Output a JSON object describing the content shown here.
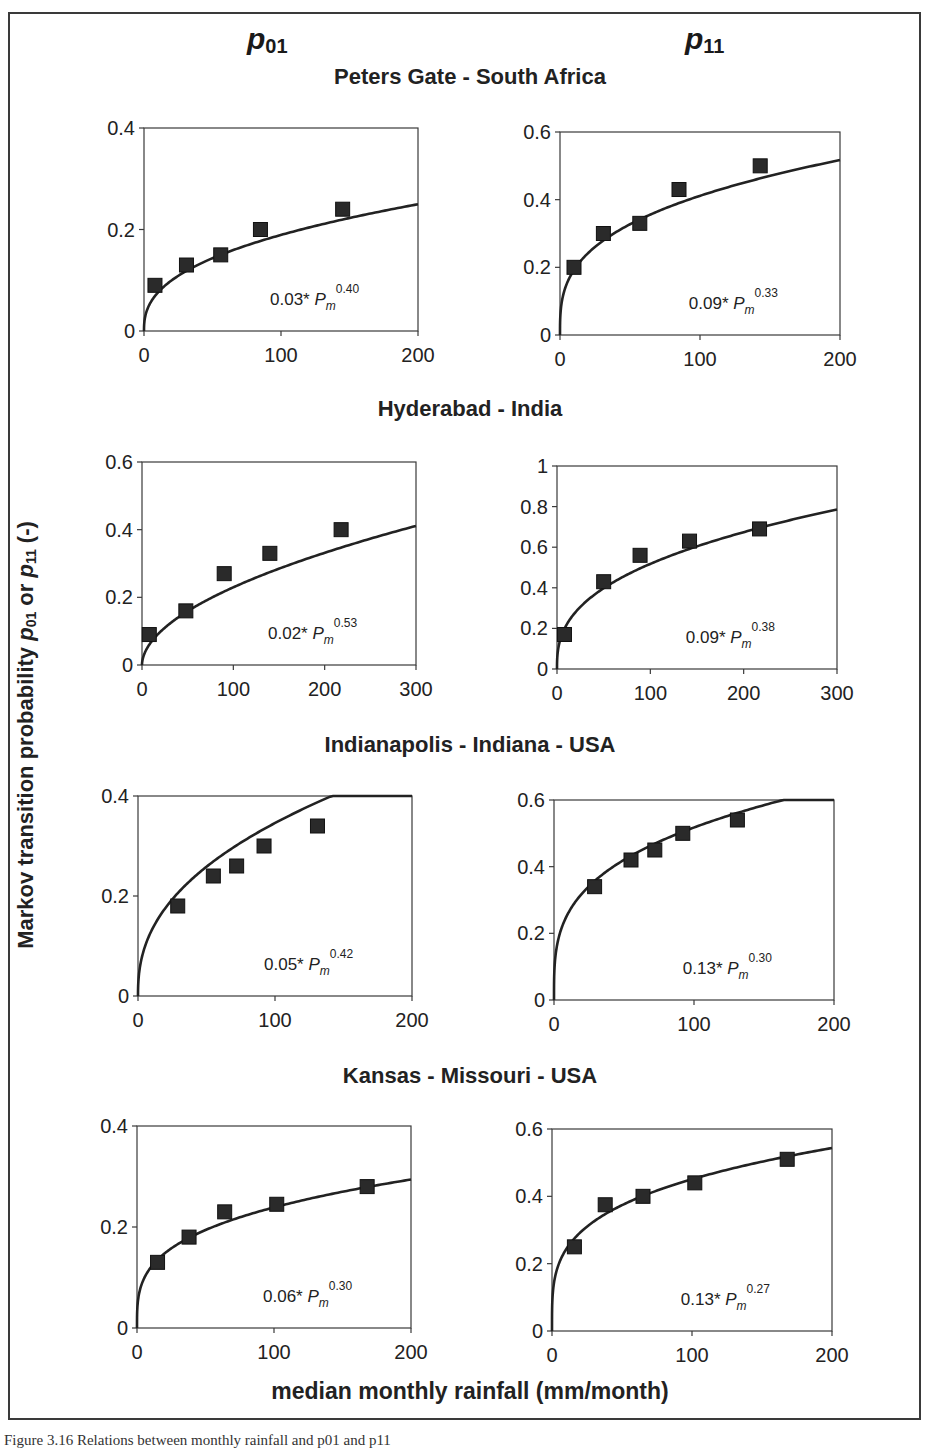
{
  "figure": {
    "column_headers": [
      {
        "base": "p",
        "sub": "01"
      },
      {
        "base": "p",
        "sub": "11"
      }
    ],
    "y_axis_label": {
      "prefix": "Markov transition probability ",
      "v1": "p",
      "s1": "01",
      "mid": " or ",
      "v2": "p",
      "s2": "11",
      "suffix": " (-)"
    },
    "x_axis_label": "median monthly rainfall (mm/month)",
    "caption": "Figure 3.16      Relations between monthly rainfall and p01 and p11"
  },
  "chart_data": [
    {
      "type": "scatter",
      "site": "Peters Gate - South Africa",
      "probability": "p01",
      "title": "",
      "xlabel": "",
      "ylabel": "",
      "xlim": [
        0,
        200
      ],
      "ylim": [
        0,
        0.4
      ],
      "xticks": [
        0,
        100,
        200
      ],
      "yticks": [
        0,
        0.2,
        0.4
      ],
      "points": {
        "x": [
          8,
          31,
          56,
          85,
          145
        ],
        "y": [
          0.09,
          0.13,
          0.15,
          0.2,
          0.24
        ]
      },
      "fit": {
        "a": 0.03,
        "b": 0.4,
        "label_coef": "0.03*",
        "label_exp": "0.40"
      },
      "grid": false
    },
    {
      "type": "scatter",
      "site": "Peters Gate - South Africa",
      "probability": "p11",
      "xlim": [
        0,
        200
      ],
      "ylim": [
        0,
        0.6
      ],
      "xticks": [
        0,
        100,
        200
      ],
      "yticks": [
        0,
        0.2,
        0.4,
        0.6
      ],
      "points": {
        "x": [
          10,
          31,
          57,
          85,
          143
        ],
        "y": [
          0.2,
          0.3,
          0.33,
          0.43,
          0.5
        ]
      },
      "fit": {
        "a": 0.09,
        "b": 0.33,
        "label_coef": "0.09*",
        "label_exp": "0.33"
      },
      "grid": false
    },
    {
      "type": "scatter",
      "site": "Hyderabad - India",
      "probability": "p01",
      "xlim": [
        0,
        300
      ],
      "ylim": [
        0,
        0.6
      ],
      "xticks": [
        0,
        100,
        200,
        300
      ],
      "yticks": [
        0,
        0.2,
        0.4,
        0.6
      ],
      "points": {
        "x": [
          8,
          48,
          90,
          140,
          218
        ],
        "y": [
          0.09,
          0.16,
          0.27,
          0.33,
          0.4
        ]
      },
      "fit": {
        "a": 0.02,
        "b": 0.53,
        "label_coef": "0.02*",
        "label_exp": "0.53"
      },
      "grid": false
    },
    {
      "type": "scatter",
      "site": "Hyderabad - India",
      "probability": "p11",
      "xlim": [
        0,
        300
      ],
      "ylim": [
        0,
        1
      ],
      "xticks": [
        0,
        100,
        200,
        300
      ],
      "yticks": [
        0,
        0.2,
        0.4,
        0.6,
        0.8,
        1
      ],
      "points": {
        "x": [
          8,
          50,
          89,
          142,
          217
        ],
        "y": [
          0.17,
          0.43,
          0.56,
          0.63,
          0.69
        ]
      },
      "fit": {
        "a": 0.09,
        "b": 0.38,
        "label_coef": "0.09*",
        "label_exp": "0.38"
      },
      "grid": false
    },
    {
      "type": "scatter",
      "site": "Indianapolis - Indiana - USA",
      "probability": "p01",
      "xlim": [
        0,
        200
      ],
      "ylim": [
        0,
        0.4
      ],
      "xticks": [
        0,
        100,
        200
      ],
      "yticks": [
        0,
        0.2,
        0.4
      ],
      "points": {
        "x": [
          29,
          55,
          72,
          92,
          131
        ],
        "y": [
          0.18,
          0.24,
          0.26,
          0.3,
          0.34
        ]
      },
      "fit": {
        "a": 0.05,
        "b": 0.42,
        "label_coef": "0.05*",
        "label_exp": "0.42"
      },
      "grid": false
    },
    {
      "type": "scatter",
      "site": "Indianapolis - Indiana - USA",
      "probability": "p11",
      "xlim": [
        0,
        200
      ],
      "ylim": [
        0,
        0.6
      ],
      "xticks": [
        0,
        100,
        200
      ],
      "yticks": [
        0,
        0.2,
        0.4,
        0.6
      ],
      "points": {
        "x": [
          29,
          55,
          72,
          92,
          131
        ],
        "y": [
          0.34,
          0.42,
          0.45,
          0.5,
          0.54
        ]
      },
      "fit": {
        "a": 0.13,
        "b": 0.3,
        "label_coef": "0.13*",
        "label_exp": "0.30"
      },
      "grid": false
    },
    {
      "type": "scatter",
      "site": "Kansas - Missouri - USA",
      "probability": "p01",
      "xlim": [
        0,
        200
      ],
      "ylim": [
        0,
        0.4
      ],
      "xticks": [
        0,
        100,
        200
      ],
      "yticks": [
        0,
        0.2,
        0.4
      ],
      "points": {
        "x": [
          15,
          38,
          64,
          102,
          168
        ],
        "y": [
          0.13,
          0.18,
          0.23,
          0.245,
          0.28
        ]
      },
      "fit": {
        "a": 0.06,
        "b": 0.3,
        "label_coef": "0.06*",
        "label_exp": "0.30"
      },
      "grid": false
    },
    {
      "type": "scatter",
      "site": "Kansas - Missouri - USA",
      "probability": "p11",
      "xlim": [
        0,
        200
      ],
      "ylim": [
        0,
        0.6
      ],
      "xticks": [
        0,
        100,
        200
      ],
      "yticks": [
        0,
        0.2,
        0.4,
        0.6
      ],
      "points": {
        "x": [
          16,
          38,
          65,
          102,
          168
        ],
        "y": [
          0.25,
          0.375,
          0.4,
          0.44,
          0.51
        ]
      },
      "fit": {
        "a": 0.13,
        "b": 0.27,
        "label_coef": "0.13*",
        "label_exp": "0.27"
      },
      "grid": false
    }
  ],
  "layout": {
    "site_title_tops": [
      64,
      396,
      732,
      1063
    ],
    "panels": [
      {
        "left": 144,
        "top": 128,
        "w": 274,
        "h": 203
      },
      {
        "left": 560,
        "top": 132,
        "w": 280,
        "h": 203
      },
      {
        "left": 142,
        "top": 462,
        "w": 274,
        "h": 203
      },
      {
        "left": 557,
        "top": 466,
        "w": 280,
        "h": 203
      },
      {
        "left": 138,
        "top": 796,
        "w": 274,
        "h": 200
      },
      {
        "left": 554,
        "top": 800,
        "w": 280,
        "h": 200
      },
      {
        "left": 137,
        "top": 1126,
        "w": 274,
        "h": 202
      },
      {
        "left": 552,
        "top": 1129,
        "w": 280,
        "h": 202
      }
    ],
    "colors": {
      "ink": "#222222",
      "marker": "#2a2a2a",
      "frame": "#3a3a3a"
    }
  }
}
